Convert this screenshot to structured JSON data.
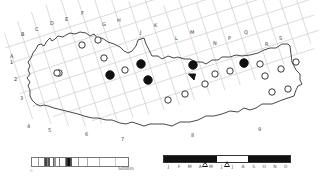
{
  "map": {
    "column_labels": [
      {
        "text": "A",
        "x": 10,
        "y": 58
      },
      {
        "text": "B",
        "x": 21,
        "y": 36
      },
      {
        "text": "C",
        "x": 35,
        "y": 31
      },
      {
        "text": "D",
        "x": 50,
        "y": 25
      },
      {
        "text": "E",
        "x": 65,
        "y": 21
      },
      {
        "text": "F",
        "x": 81,
        "y": 15
      },
      {
        "text": "G",
        "x": 102,
        "y": 26
      },
      {
        "text": "H",
        "x": 117,
        "y": 22
      },
      {
        "text": "J",
        "x": 140,
        "y": 34
      },
      {
        "text": "K",
        "x": 154,
        "y": 27
      },
      {
        "text": "L",
        "x": 175,
        "y": 40
      },
      {
        "text": "M",
        "x": 190,
        "y": 34
      },
      {
        "text": "N",
        "x": 213,
        "y": 45
      },
      {
        "text": "P",
        "x": 228,
        "y": 40
      },
      {
        "text": "Q",
        "x": 244,
        "y": 34
      },
      {
        "text": "R",
        "x": 265,
        "y": 46
      },
      {
        "text": "S",
        "x": 279,
        "y": 40
      }
    ],
    "row_labels": [
      {
        "text": "1",
        "x": 10,
        "y": 64
      },
      {
        "text": "2",
        "x": 14,
        "y": 81
      },
      {
        "text": "3",
        "x": 20,
        "y": 100
      },
      {
        "text": "4",
        "x": 27,
        "y": 128
      },
      {
        "text": "5",
        "x": 48,
        "y": 132
      },
      {
        "text": "6",
        "x": 85,
        "y": 136
      },
      {
        "text": "7",
        "x": 121,
        "y": 141
      },
      {
        "text": "8",
        "x": 191,
        "y": 137
      },
      {
        "text": "9",
        "x": 258,
        "y": 131
      }
    ],
    "records_open_circle": [
      [
        82,
        45
      ],
      [
        98,
        40
      ],
      [
        104,
        58
      ],
      [
        59,
        73
      ],
      [
        125,
        70
      ],
      [
        205,
        84
      ],
      [
        215,
        74
      ],
      [
        230,
        71
      ],
      [
        244,
        64
      ],
      [
        260,
        64
      ],
      [
        265,
        76
      ],
      [
        281,
        69
      ],
      [
        296,
        62
      ],
      [
        272,
        92
      ],
      [
        288,
        89
      ],
      [
        185,
        94
      ],
      [
        168,
        100
      ],
      [
        57,
        73
      ]
    ],
    "records_filled_circle": [
      [
        110,
        75
      ],
      [
        141,
        64
      ],
      [
        148,
        80
      ],
      [
        193,
        65
      ],
      [
        244,
        63
      ]
    ],
    "records_filled_triangle": [
      [
        192,
        77
      ]
    ],
    "legend": {
      "altitude_scale_label": "5000m",
      "altitude_zero": "0",
      "altitude_bands": [
        {
          "w": 4,
          "c": "#ffffff"
        },
        {
          "w": 1,
          "c": "#999"
        },
        {
          "w": 3,
          "c": "#fff"
        },
        {
          "w": 1,
          "c": "#666"
        },
        {
          "w": 1,
          "c": "#444"
        },
        {
          "w": 1,
          "c": "#888"
        },
        {
          "w": 1,
          "c": "#555"
        },
        {
          "w": 2,
          "c": "#fff"
        },
        {
          "w": 1,
          "c": "#666"
        },
        {
          "w": 1,
          "c": "#999"
        },
        {
          "w": 2,
          "c": "#fff"
        },
        {
          "w": 1,
          "c": "#777"
        },
        {
          "w": 3,
          "c": "#fff"
        },
        {
          "w": 1,
          "c": "#888"
        },
        {
          "w": 1,
          "c": "#333"
        },
        {
          "w": 2,
          "c": "#111"
        },
        {
          "w": 1,
          "c": "#555"
        },
        {
          "w": 4,
          "c": "#fff"
        },
        {
          "w": 1,
          "c": "#999"
        },
        {
          "w": 5,
          "c": "#fff"
        },
        {
          "w": 1,
          "c": "#aaa"
        },
        {
          "w": 7,
          "c": "#fff"
        },
        {
          "w": 1,
          "c": "#bbb"
        },
        {
          "w": 10,
          "c": "#fff"
        },
        {
          "w": 1,
          "c": "#ccc"
        },
        {
          "w": 8,
          "c": "#fff"
        }
      ],
      "months": [
        "J",
        "F",
        "M",
        "A",
        "M",
        "J",
        "J",
        "A",
        "S",
        "O",
        "N",
        "D"
      ],
      "month_bar_segments": [
        {
          "months": 5,
          "color": "#111111"
        },
        {
          "months": 3,
          "color": "#ffffff"
        },
        {
          "months": 4,
          "color": "#111111"
        }
      ],
      "month_markers_pct": [
        33,
        50
      ]
    }
  }
}
